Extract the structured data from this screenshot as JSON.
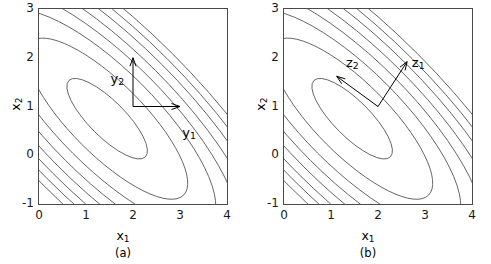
{
  "figure": {
    "panels": [
      {
        "caption": "(a)",
        "xlabel_base": "x",
        "xlabel_sub": "1",
        "ylabel_base": "x",
        "ylabel_sub": "2",
        "xticks": [
          "0",
          "1",
          "2",
          "3",
          "4"
        ],
        "yticks": [
          "3",
          "2",
          "1",
          "0",
          "-1"
        ],
        "vectors": [
          {
            "name": "y1",
            "base": "y",
            "sub": "1",
            "origin": [
              2,
              1
            ],
            "tip": [
              3,
              1
            ],
            "label_pos": [
              3.05,
              0.62
            ]
          },
          {
            "name": "y2",
            "base": "y",
            "sub": "2",
            "origin": [
              2,
              1
            ],
            "tip": [
              2,
              2
            ],
            "label_pos": [
              1.52,
              1.72
            ]
          }
        ]
      },
      {
        "caption": "(b)",
        "xlabel_base": "x",
        "xlabel_sub": "1",
        "ylabel_base": "x",
        "ylabel_sub": "2",
        "xticks": [
          "0",
          "1",
          "2",
          "3",
          "4"
        ],
        "yticks": [
          "3",
          "2",
          "1",
          "0",
          "-1"
        ],
        "vectors": [
          {
            "name": "z1",
            "base": "z",
            "sub": "1",
            "origin": [
              2,
              1
            ],
            "tip": [
              2.62,
              1.92
            ],
            "label_pos": [
              2.72,
              2.05
            ]
          },
          {
            "name": "z2",
            "base": "z",
            "sub": "2",
            "origin": [
              2,
              1
            ],
            "tip": [
              1.12,
              1.62
            ],
            "label_pos": [
              1.32,
              2.06
            ]
          }
        ]
      }
    ]
  },
  "chart_data": {
    "type": "line",
    "title": "",
    "subtitle": "",
    "xlabel": "x1",
    "ylabel": "x2",
    "xlim": [
      0,
      4
    ],
    "ylim": [
      -1,
      3
    ],
    "xticks": [
      0,
      1,
      2,
      3,
      4
    ],
    "yticks": [
      -1,
      0,
      1,
      2,
      3
    ],
    "grid": false,
    "legend": null,
    "contours": {
      "center": [
        1.45,
        0.75
      ],
      "rotation_deg": -45,
      "semi_major_over_semi_minor": 3.1,
      "levels": [
        1,
        2,
        3,
        4,
        5,
        6,
        7,
        8
      ],
      "semi_major_axes": [
        1.15,
        2.3,
        3.1,
        3.75,
        4.35,
        4.9,
        5.4,
        5.85
      ],
      "semi_minor_axes": [
        0.37,
        0.74,
        1.0,
        1.21,
        1.4,
        1.58,
        1.74,
        1.89
      ]
    },
    "annotations": [
      {
        "panel": "(a)",
        "label": "y1",
        "type": "vector",
        "origin": [
          2,
          1
        ],
        "tip": [
          3,
          1
        ],
        "direction_deg": 0
      },
      {
        "panel": "(a)",
        "label": "y2",
        "type": "vector",
        "origin": [
          2,
          1
        ],
        "tip": [
          2,
          2
        ],
        "direction_deg": 90
      },
      {
        "panel": "(b)",
        "label": "z1",
        "type": "vector",
        "origin": [
          2,
          1
        ],
        "tip": [
          2.62,
          1.92
        ],
        "direction_deg": 56
      },
      {
        "panel": "(b)",
        "label": "z2",
        "type": "vector",
        "origin": [
          2,
          1
        ],
        "tip": [
          1.12,
          1.62
        ],
        "direction_deg": 145
      }
    ],
    "series": [
      {
        "name": "contour-level-1",
        "values": [
          1
        ]
      },
      {
        "name": "contour-level-2",
        "values": [
          2
        ]
      },
      {
        "name": "contour-level-3",
        "values": [
          3
        ]
      },
      {
        "name": "contour-level-4",
        "values": [
          4
        ]
      },
      {
        "name": "contour-level-5",
        "values": [
          5
        ]
      },
      {
        "name": "contour-level-6",
        "values": [
          6
        ]
      },
      {
        "name": "contour-level-7",
        "values": [
          7
        ]
      },
      {
        "name": "contour-level-8",
        "values": [
          8
        ]
      }
    ]
  },
  "colors": {
    "contour": "#555555",
    "axis": "#4a4a4a",
    "text": "#000000"
  }
}
